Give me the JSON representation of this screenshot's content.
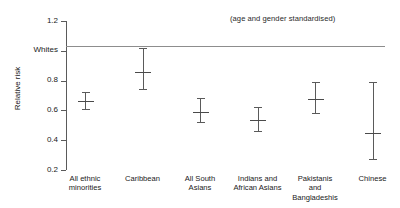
{
  "chart_data": {
    "type": "scatter",
    "title": "",
    "annotation": "(age and gender standardised)",
    "xlabel": "",
    "ylabel": "Relative risk",
    "ylim": [
      0.2,
      1.2
    ],
    "grid": false,
    "legend": null,
    "reference_line": {
      "label": "Whites",
      "value": 1.0
    },
    "ytick_values": [
      1.2,
      1.0,
      0.8,
      0.6,
      0.4,
      0.2
    ],
    "ytick_labels": [
      "1.2",
      "Whites",
      "0.8",
      "0.6",
      "0.4",
      "0.2"
    ],
    "categories": [
      "All ethnic minorities",
      "Caribbean",
      "All South Asians",
      "Indians and African Asians",
      "Pakistanis and Bangladeshis",
      "Chinese"
    ],
    "category_lines": [
      [
        "All ethnic",
        "minorities"
      ],
      [
        "Caribbean"
      ],
      [
        "All South",
        "Asians"
      ],
      [
        "Indians and",
        "African Asians"
      ],
      [
        "Pakistanis",
        "and",
        "Bangladeshis"
      ],
      [
        "Chinese"
      ]
    ],
    "values": [
      0.665,
      0.855,
      0.59,
      0.535,
      0.675,
      0.445
    ],
    "ci_low": [
      0.61,
      0.745,
      0.52,
      0.465,
      0.585,
      0.275
    ],
    "ci_high": [
      0.725,
      1.02,
      0.68,
      0.625,
      0.79,
      0.79
    ],
    "series": [
      {
        "name": "Relative risk",
        "points": [
          {
            "category": "All ethnic minorities",
            "value": 0.665,
            "ci_low": 0.61,
            "ci_high": 0.725
          },
          {
            "category": "Caribbean",
            "value": 0.855,
            "ci_low": 0.745,
            "ci_high": 1.02
          },
          {
            "category": "All South Asians",
            "value": 0.59,
            "ci_low": 0.52,
            "ci_high": 0.68
          },
          {
            "category": "Indians and African Asians",
            "value": 0.535,
            "ci_low": 0.465,
            "ci_high": 0.625
          },
          {
            "category": "Pakistanis and Bangladeshis",
            "value": 0.675,
            "ci_low": 0.585,
            "ci_high": 0.79
          },
          {
            "category": "Chinese",
            "value": 0.445,
            "ci_low": 0.275,
            "ci_high": 0.79
          }
        ]
      }
    ],
    "colors": {
      "axis": "#5a5a5a",
      "marker": "#4a4a4a",
      "reference_line": "#8d8d8d",
      "background": "#ffffff",
      "text": "#1a1a1a"
    }
  }
}
